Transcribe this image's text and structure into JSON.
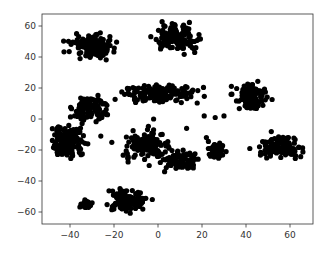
{
  "chart_data": {
    "type": "scatter",
    "title": "",
    "xlabel": "",
    "ylabel": "",
    "xlim": [
      -52,
      70
    ],
    "ylim": [
      -68,
      67
    ],
    "grid": false,
    "legend": null,
    "marker_color": "#000000",
    "xticks": [
      -40,
      -20,
      0,
      20,
      40,
      60
    ],
    "yticks": [
      -60,
      -40,
      -20,
      0,
      20,
      40,
      60
    ],
    "xtick_labels": [
      "−40",
      "−20",
      "0",
      "20",
      "40",
      "60"
    ],
    "ytick_labels": [
      "−60",
      "−40",
      "−20",
      "0",
      "20",
      "40",
      "60"
    ],
    "clusters": [
      {
        "name": "cluster-1",
        "center": [
          -30,
          47
        ],
        "spread": [
          7,
          5
        ],
        "n": 140
      },
      {
        "name": "cluster-2",
        "center": [
          9,
          52
        ],
        "spread": [
          7,
          6
        ],
        "n": 120
      },
      {
        "name": "cluster-3",
        "center": [
          0,
          16
        ],
        "spread": [
          12,
          4
        ],
        "n": 140
      },
      {
        "name": "cluster-4",
        "center": [
          -31,
          7
        ],
        "spread": [
          5,
          6
        ],
        "n": 110
      },
      {
        "name": "cluster-5",
        "center": [
          -41,
          -15
        ],
        "spread": [
          5,
          8
        ],
        "n": 150
      },
      {
        "name": "cluster-6",
        "center": [
          -5,
          -17
        ],
        "spread": [
          7,
          6
        ],
        "n": 150
      },
      {
        "name": "cluster-7",
        "center": [
          11,
          -26
        ],
        "spread": [
          5,
          4
        ],
        "n": 80
      },
      {
        "name": "cluster-8",
        "center": [
          42,
          14
        ],
        "spread": [
          5,
          6
        ],
        "n": 110
      },
      {
        "name": "cluster-9",
        "center": [
          55,
          -18
        ],
        "spread": [
          7,
          5
        ],
        "n": 120
      },
      {
        "name": "cluster-10",
        "center": [
          27,
          -20
        ],
        "spread": [
          3,
          4
        ],
        "n": 45
      },
      {
        "name": "cluster-11",
        "center": [
          -14,
          -52
        ],
        "spread": [
          6,
          5
        ],
        "n": 130
      },
      {
        "name": "cluster-12",
        "center": [
          -33,
          -55
        ],
        "spread": [
          2,
          2
        ],
        "n": 20
      }
    ],
    "outliers": [
      [
        -21,
        -15
      ],
      [
        -26,
        -11
      ],
      [
        -2,
        -7
      ],
      [
        -2,
        0
      ],
      [
        13,
        -6
      ],
      [
        3,
        -34
      ],
      [
        -4,
        -30
      ],
      [
        21,
        2
      ],
      [
        26,
        1
      ],
      [
        30,
        2
      ],
      [
        22,
        -12
      ],
      [
        -35,
        -23
      ]
    ]
  }
}
